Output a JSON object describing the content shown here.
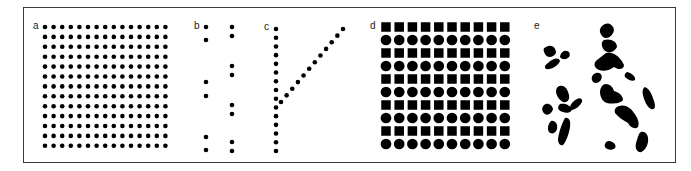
{
  "figure": {
    "panels": [
      {
        "id": "a",
        "label": "a",
        "description": "regular grid of dots",
        "rows": 13,
        "cols": 15,
        "origin": [
          45,
          27
        ],
        "spacing": [
          8.6,
          9.9
        ],
        "dot_radius": 2.3
      },
      {
        "id": "b",
        "label": "b",
        "description": "two columns of paired dots",
        "columns": [
          {
            "x": 206,
            "ys": [
              27,
              40,
              82,
              96,
              137,
              150
            ]
          },
          {
            "x": 232,
            "ys": [
              27,
              36,
              66,
              75,
              105,
              114,
              142,
              151
            ]
          }
        ],
        "dot_radius": 2.3
      },
      {
        "id": "c",
        "label": "c",
        "description": "vertical dot line with diagonal branch",
        "vertical": {
          "x": 276,
          "y_start": 29,
          "y_end": 151,
          "count": 15
        },
        "diagonal": {
          "x_start": 281,
          "y_start": 102,
          "x_end": 343,
          "y_end": 29,
          "count": 12
        },
        "dot_radius": 2.3
      },
      {
        "id": "d",
        "label": "d",
        "description": "alternating rows of squares and circles",
        "rows": 10,
        "cols": 10,
        "origin": [
          386,
          27
        ],
        "spacing": [
          13.2,
          13.0
        ],
        "row_pattern": [
          "square",
          "circle"
        ],
        "shape_size": 9.5
      },
      {
        "id": "e",
        "label": "e",
        "description": "irregular blob shapes"
      }
    ],
    "colors": {
      "ink": "#000000",
      "background": "#ffffff",
      "frame": "#3a3a3a"
    }
  }
}
